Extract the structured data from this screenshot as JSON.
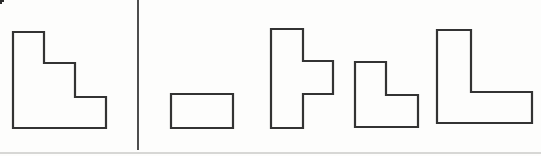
{
  "canvas": {
    "width": 541,
    "height": 156,
    "background": "#fdfdfc"
  },
  "style": {
    "shape_stroke_color": "#333333",
    "shape_stroke_width": 2.2,
    "shape_fill": "#fdfdfc",
    "divider_color": "#3a3a3a",
    "divider_width": 1.8,
    "bottom_rule_color": "#d7d7d5",
    "bottom_rule_width": 2,
    "corner_mark_color": "#2b2b2b"
  },
  "divider": {
    "x": 138,
    "y_start": 0,
    "y_end": 150
  },
  "bottom_rule": {
    "x_start": 0,
    "x_end": 541,
    "y": 153
  },
  "corner_mark": {
    "points": [
      [
        0,
        0
      ],
      [
        4,
        0
      ],
      [
        4,
        2
      ],
      [
        2,
        2
      ],
      [
        2,
        4
      ],
      [
        0,
        4
      ]
    ]
  },
  "shapes": [
    {
      "name": "target-staircase-shape",
      "role": "target figure (left of divider)",
      "points": [
        [
          13,
          32
        ],
        [
          44,
          32
        ],
        [
          44,
          63
        ],
        [
          75,
          63
        ],
        [
          75,
          97
        ],
        [
          106,
          97
        ],
        [
          106,
          128
        ],
        [
          13,
          128
        ]
      ]
    },
    {
      "name": "piece-rectangle",
      "role": "candidate piece 1",
      "points": [
        [
          171,
          94
        ],
        [
          233,
          94
        ],
        [
          233,
          128
        ],
        [
          171,
          128
        ]
      ]
    },
    {
      "name": "piece-t-shape",
      "role": "candidate piece 2",
      "points": [
        [
          271,
          29
        ],
        [
          303,
          29
        ],
        [
          303,
          61
        ],
        [
          333,
          61
        ],
        [
          333,
          94
        ],
        [
          303,
          94
        ],
        [
          303,
          128
        ],
        [
          271,
          128
        ]
      ]
    },
    {
      "name": "piece-small-l-shape",
      "role": "candidate piece 3",
      "points": [
        [
          355,
          62
        ],
        [
          386,
          62
        ],
        [
          386,
          95
        ],
        [
          418,
          95
        ],
        [
          418,
          127
        ],
        [
          355,
          127
        ]
      ]
    },
    {
      "name": "piece-large-l-shape",
      "role": "candidate piece 4",
      "points": [
        [
          437,
          30
        ],
        [
          471,
          30
        ],
        [
          471,
          92
        ],
        [
          532,
          92
        ],
        [
          532,
          123
        ],
        [
          437,
          123
        ]
      ]
    }
  ]
}
